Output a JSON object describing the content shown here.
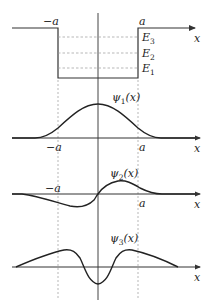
{
  "diagram": {
    "colors": {
      "line": "#333333",
      "dashed": "#8a8a8a",
      "background": "#ffffff"
    },
    "potential_well": {
      "left_label": "−a",
      "right_label": "a",
      "axis_label": "x",
      "levels": [
        {
          "label": "E",
          "sub": "3"
        },
        {
          "label": "E",
          "sub": "2"
        },
        {
          "label": "E",
          "sub": "1"
        }
      ]
    },
    "psi1": {
      "label": "ψ",
      "sub": "1",
      "arg": "(x)",
      "left_label": "−a",
      "right_label": "a",
      "axis_label": "x"
    },
    "psi2": {
      "label": "ψ",
      "sub": "2",
      "arg": "(x)",
      "left_label": "−a",
      "right_label": "a",
      "axis_label": "x"
    },
    "psi3": {
      "label": "ψ",
      "sub": "3",
      "arg": "(x)",
      "axis_label": "x"
    }
  }
}
